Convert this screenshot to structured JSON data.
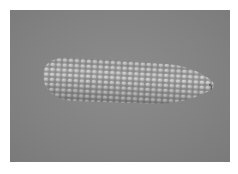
{
  "image": {
    "description": "Grayscale photograph of a single ear of corn on a gray background",
    "subject": "corn-ear",
    "background_color": "#848484",
    "border_color": "#ffffff",
    "kernel_color": "#c8c8c8"
  }
}
